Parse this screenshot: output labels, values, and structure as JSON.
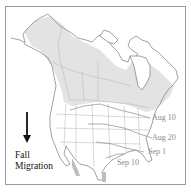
{
  "map": {
    "title_line1": "Fall",
    "title_line2": "Migration",
    "arrow_direction": "down-arrow-icon",
    "colors": {
      "range_fill": "#e3e3e3",
      "coast": "#7a7a7a",
      "borders": "#b0b0b0",
      "isochrone": "#8c8c8c",
      "label": "#8a8a8a",
      "text": "#111111"
    },
    "isochrones": [
      {
        "label": "Aug 10"
      },
      {
        "label": "Aug 20"
      },
      {
        "label": "Sep 1"
      },
      {
        "label": "Sep 10"
      }
    ]
  }
}
